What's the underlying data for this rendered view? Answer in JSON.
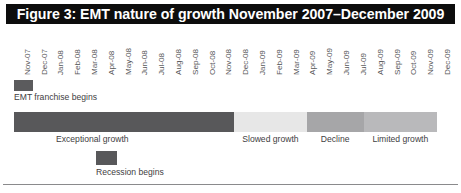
{
  "figure": {
    "title": "Figure 3: EMT nature of growth November 2007–December 2009",
    "title_bg": "#0d0d0d",
    "title_color": "#ffffff"
  },
  "axis": {
    "orientation": "vertical-rotated",
    "labels": [
      "Nov-07",
      "Dec-07",
      "Jan-08",
      "Feb-08",
      "Mar-08",
      "Apr-08",
      "May-08",
      "Jun-08",
      "Jul-08",
      "Aug-08",
      "Sep-08",
      "Oct-08",
      "Nov-08",
      "Dec-08",
      "Jan-09",
      "Feb-09",
      "Mar-09",
      "Apr-09",
      "May-09",
      "Jun-09",
      "Jul-09",
      "Aug-09",
      "Sep-09",
      "Oct-09",
      "Nov-09",
      "Dec-09"
    ]
  },
  "markers": [
    {
      "key": "emt-franchise-begins",
      "label": "EMT franchise begins",
      "color": "#5b5b5d"
    },
    {
      "key": "recession-begins",
      "label": "Recession begins",
      "color": "#58585a"
    }
  ],
  "chart_data": {
    "type": "bar",
    "orientation": "horizontal-timeline",
    "title": "Figure 3: EMT nature of growth November 2007–December 2009",
    "xlabel": "",
    "ylabel": "",
    "x": [
      "Nov-07",
      "Dec-07",
      "Jan-08",
      "Feb-08",
      "Mar-08",
      "Apr-08",
      "May-08",
      "Jun-08",
      "Jul-08",
      "Aug-08",
      "Sep-08",
      "Oct-08",
      "Nov-08",
      "Dec-08",
      "Jan-09",
      "Feb-09",
      "Mar-09",
      "Apr-09",
      "May-09",
      "Jun-09",
      "Jul-09",
      "Aug-09",
      "Sep-09",
      "Oct-09",
      "Nov-09",
      "Dec-09"
    ],
    "categories": [
      "Exceptional growth",
      "Slowed growth",
      "Decline",
      "Limited growth"
    ],
    "values": [
      13.5,
      4.5,
      3.5,
      4.5
    ],
    "colors": [
      "#58585a",
      "#e7e7e7",
      "#a6a6a8",
      "#b9b9bb"
    ],
    "segments": [
      {
        "label": "Exceptional growth",
        "start": "Nov-07",
        "end": "Dec-08",
        "months": 13.5,
        "color": "#58585a"
      },
      {
        "label": "Slowed growth",
        "start": "Dec-08",
        "end": "Apr-09",
        "months": 4.5,
        "color": "#e7e7e7"
      },
      {
        "label": "Decline",
        "start": "Apr-09",
        "end": "Aug-09",
        "months": 3.5,
        "color": "#a6a6a8"
      },
      {
        "label": "Limited growth",
        "start": "Aug-09",
        "end": "Dec-09",
        "months": 4.5,
        "color": "#b9b9bb"
      }
    ],
    "annotations": [
      {
        "text": "EMT franchise begins",
        "at": "Nov-07"
      },
      {
        "text": "Recession begins",
        "at": "Jun-08"
      }
    ],
    "legend": "none",
    "grid": false
  }
}
